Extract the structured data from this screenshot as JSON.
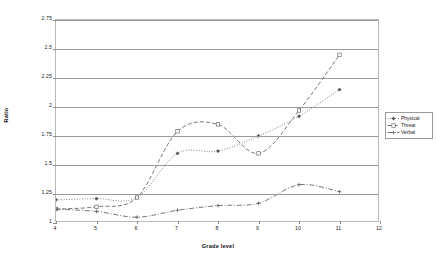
{
  "chart_data": {
    "type": "line",
    "title": "",
    "xlabel": "Grade level",
    "ylabel": "Ratio",
    "x": [
      4,
      5,
      6,
      7,
      8,
      9,
      10,
      11
    ],
    "xlim": [
      4,
      12
    ],
    "ylim": [
      1,
      2.75
    ],
    "xticks": [
      "4",
      "5",
      "6",
      "7",
      "8",
      "9",
      "10",
      "11",
      "12"
    ],
    "yticks": [
      "1",
      "1.25",
      "1.5",
      "1.75",
      "2",
      "2.25",
      "2.5",
      "2.75"
    ],
    "grid": "horizontal",
    "legend_position": "right",
    "series": [
      {
        "name": "Physical",
        "marker": "filled-diamond",
        "linestyle": "dotted",
        "color": "#555555",
        "values": [
          1.2,
          1.21,
          1.22,
          1.6,
          1.62,
          1.75,
          1.92,
          2.15
        ]
      },
      {
        "name": "Threat",
        "marker": "open-square",
        "linestyle": "dashed",
        "color": "#555555",
        "values": [
          1.12,
          1.14,
          1.22,
          1.79,
          1.85,
          1.6,
          1.97,
          2.45
        ]
      },
      {
        "name": "Verbal",
        "marker": "plus",
        "linestyle": "dash-dot",
        "color": "#555555",
        "values": [
          1.12,
          1.1,
          1.05,
          1.11,
          1.15,
          1.17,
          1.33,
          1.27
        ]
      }
    ]
  },
  "legend": {
    "items": [
      {
        "label": "Physical"
      },
      {
        "label": "Threat"
      },
      {
        "label": "Verbal"
      }
    ]
  }
}
